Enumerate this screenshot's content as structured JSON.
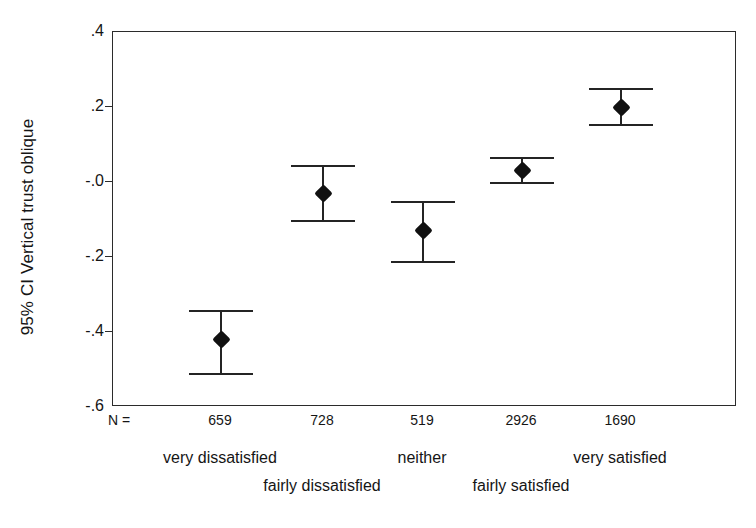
{
  "chart_data": {
    "type": "scatter",
    "title": "",
    "subtitle": "",
    "xlabel": "",
    "ylabel": "95% CI Vertical trust oblique",
    "ylim": [
      -0.6,
      0.4
    ],
    "ytick_labels": [
      ".4",
      ".2",
      "-.0",
      "-.2",
      "-.4",
      "-.6"
    ],
    "ytick_values": [
      0.4,
      0.2,
      0.0,
      -0.2,
      -0.4,
      -0.6
    ],
    "grid": false,
    "legend": null,
    "n_label": "N =",
    "categories": [
      "very dissatisfied",
      "fairly dissatisfied",
      "neither",
      "fairly satisfied",
      "very satisfied"
    ],
    "n_values": [
      "659",
      "728",
      "519",
      "2926",
      "1690"
    ],
    "values": [
      -0.42,
      -0.03,
      -0.13,
      0.03,
      0.2
    ],
    "ci_lower": [
      -0.51,
      -0.1,
      -0.21,
      0.0,
      0.155
    ],
    "ci_upper": [
      -0.34,
      0.045,
      -0.05,
      0.068,
      0.25
    ],
    "points": [
      {
        "category": "very dissatisfied",
        "label_row": 1,
        "n": "659",
        "mean": -0.42,
        "ci_lower": -0.51,
        "ci_upper": -0.34
      },
      {
        "category": "fairly dissatisfied",
        "label_row": 2,
        "n": "728",
        "mean": -0.03,
        "ci_lower": -0.1,
        "ci_upper": 0.045
      },
      {
        "category": "neither",
        "label_row": 1,
        "n": "519",
        "mean": -0.13,
        "ci_lower": -0.21,
        "ci_upper": -0.05
      },
      {
        "category": "fairly satisfied",
        "label_row": 2,
        "n": "2926",
        "mean": 0.03,
        "ci_lower": 0.0,
        "ci_upper": 0.068
      },
      {
        "category": "very satisfied",
        "label_row": 1,
        "n": "1690",
        "mean": 0.2,
        "ci_lower": 0.155,
        "ci_upper": 0.25
      }
    ],
    "colors": {
      "marker": "#111111",
      "error_bar": "#242424",
      "axis": "#2b2b2b",
      "text": "#151515",
      "background": "#ffffff"
    }
  }
}
